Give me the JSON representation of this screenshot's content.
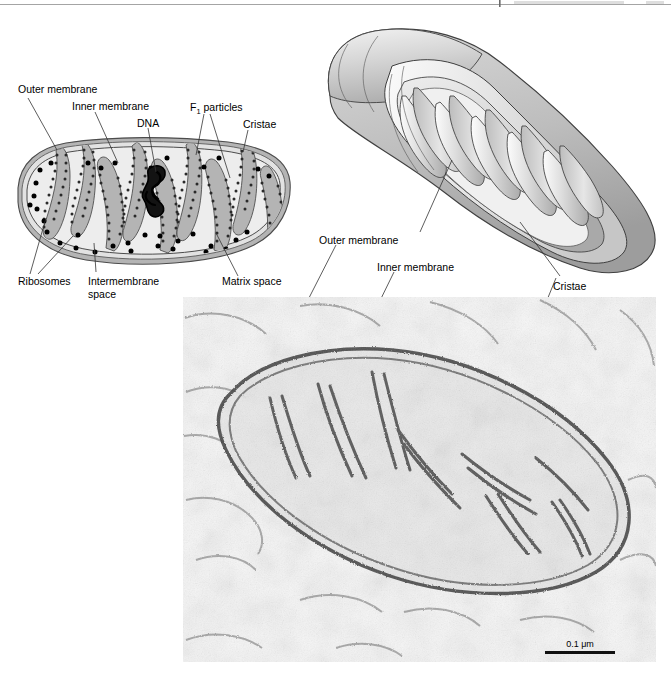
{
  "page": {
    "width": 671,
    "height": 675,
    "background": "#ffffff",
    "header_rule_visible": true
  },
  "figure": {
    "panels": [
      {
        "id": "cross-section-diagram",
        "name": "Cross-sectional diagram of a mitochondrion",
        "type": "line-drawing"
      },
      {
        "id": "three-d-diagram",
        "name": "Three-dimensional cutaway diagram of a mitochondrion",
        "type": "shaded-drawing"
      },
      {
        "id": "electron-micrograph",
        "name": "Transmission electron micrograph of a mitochondrion",
        "type": "photomicrograph"
      }
    ]
  },
  "cross_section_labels": {
    "outer_membrane": "Outer membrane",
    "inner_membrane": "Inner membrane",
    "dna": "DNA",
    "f1_particles_prefix": "F",
    "f1_particles_sub": "1",
    "f1_particles_suffix": " particles",
    "cristae": "Cristae",
    "ribosomes": "Ribosomes",
    "intermembrane_space_line1": "Intermembrane",
    "intermembrane_space_line2": "space",
    "matrix_space": "Matrix space"
  },
  "micrograph_labels": {
    "outer_membrane": "Outer membrane",
    "inner_membrane": "Inner membrane",
    "cristae": "Cristae"
  },
  "scale_bar": {
    "value": "0.1",
    "unit": "μm",
    "text": "0.1 μm"
  },
  "colors": {
    "membrane_gray": "#a8a8a8",
    "matrix_fill": "#ebebeb",
    "outline": "#555555",
    "dot_black": "#111111",
    "diagram_shade_light": "#e8e8e8",
    "diagram_shade_mid": "#c4c4c4",
    "diagram_shade_dark": "#9c9c9c",
    "label_text": "#000000"
  }
}
